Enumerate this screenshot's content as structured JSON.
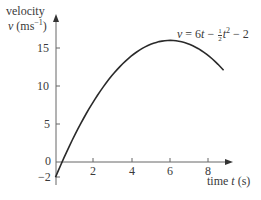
{
  "chart_data": {
    "type": "line",
    "title": "",
    "equation": "v = 6t − ½t² − 2",
    "equation_parts": {
      "lhs": "v",
      "eq": " = 6",
      "t1": "t",
      "minus": " − ",
      "num": "1",
      "den": "2",
      "t2": "t",
      "sq": "2",
      "tail": " − 2"
    },
    "xlabel": "time t (s)",
    "xlabel_parts": {
      "pre": "time ",
      "var": "t",
      "post": " (s)"
    },
    "ylabel": [
      "velocity",
      "v (ms⁻¹)"
    ],
    "ylabel_parts": {
      "line1": "velocity",
      "var": "v",
      "unit_pre": " (ms",
      "unit_sup": "−1",
      "unit_post": ")"
    },
    "x_ticks": [
      "2",
      "4",
      "6",
      "8"
    ],
    "y_ticks": [
      "15",
      "10",
      "5",
      "0",
      "−2"
    ],
    "xlim": [
      0,
      9
    ],
    "ylim": [
      -2,
      18
    ],
    "grid": false,
    "series": [
      {
        "name": "v = 6t − ½t² − 2",
        "x": [
          0,
          1,
          2,
          3,
          4,
          5,
          6,
          7,
          8,
          8.8
        ],
        "y": [
          -2,
          3.5,
          8,
          11.5,
          14,
          15.5,
          16,
          15.5,
          14,
          12.08
        ]
      }
    ],
    "color": "#2a2a2a"
  }
}
